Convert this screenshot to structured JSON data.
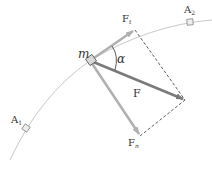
{
  "diagram": {
    "colors": {
      "background": "#ffffff",
      "path": "#c8c8c8",
      "force": "#7a7a7a",
      "component": "#b0b0b0",
      "dashed": "#333333",
      "text": "#333333",
      "block": "#d8d8d8"
    },
    "labels": {
      "mass": "m",
      "angle": "α",
      "force": "F",
      "tangential": {
        "main": "F",
        "sub": "t"
      },
      "normal": {
        "main": "F",
        "sub": "n"
      },
      "point_a1": {
        "main": "A",
        "sub": "1"
      },
      "point_a2": {
        "main": "A",
        "sub": "2"
      }
    },
    "points": {
      "mass": [
        91,
        60
      ],
      "tangential_tip": [
        135,
        30
      ],
      "force_tip": [
        185,
        100
      ],
      "normal_tip": [
        140,
        136
      ],
      "a1": [
        26,
        128
      ],
      "a2": [
        190,
        22
      ]
    }
  }
}
